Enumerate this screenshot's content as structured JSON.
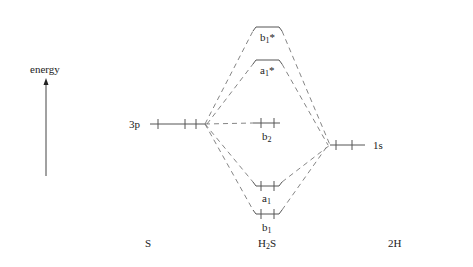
{
  "diagram": {
    "type": "molecular-orbital-diagram",
    "axis_label": "energy",
    "columns": {
      "left": "S",
      "center": {
        "base": "H",
        "sub": "2",
        "rest": "S"
      },
      "right": "2H"
    },
    "atomic_orbitals": {
      "sulfur": {
        "label": "3p",
        "electrons": 4
      },
      "hydrogen": {
        "label": "1s",
        "electrons": 2
      }
    },
    "molecular_orbitals": [
      {
        "name": "b1*",
        "base": "b",
        "sub": "1",
        "sup": "*",
        "type": "antibonding",
        "electrons": 0
      },
      {
        "name": "a1*",
        "base": "a",
        "sub": "1",
        "sup": "*",
        "type": "antibonding",
        "electrons": 0
      },
      {
        "name": "b2",
        "base": "b",
        "sub": "2",
        "sup": "",
        "type": "nonbonding",
        "electrons": 2
      },
      {
        "name": "a1",
        "base": "a",
        "sub": "1",
        "sup": "",
        "type": "bonding",
        "electrons": 2
      },
      {
        "name": "b1",
        "base": "b",
        "sub": "1",
        "sup": "",
        "type": "bonding",
        "electrons": 2
      }
    ],
    "colors": {
      "line": "#555555",
      "dash": "#777777",
      "text": "#222222"
    }
  }
}
